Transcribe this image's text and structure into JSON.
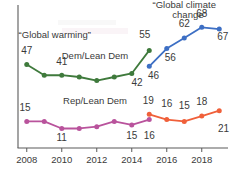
{
  "chart_data": {
    "type": "line",
    "title": "",
    "xlabel": "",
    "ylabel": "",
    "xlim": [
      2007.5,
      2019.5
    ],
    "ylim": [
      0,
      80
    ],
    "grid": false,
    "legend_position": "inline-annotations",
    "x_ticks": [
      "2008",
      "2010",
      "2012",
      "2014",
      "2016",
      "2018"
    ],
    "x_tick_values": [
      2008,
      2010,
      2012,
      2014,
      2016,
      2018
    ],
    "annotations": [
      {
        "text": "“Global warming”",
        "x": 2009.6,
        "y": 62
      },
      {
        "text": "“Global climate",
        "x": 2017.0,
        "y": 79
      },
      {
        "text": "change”",
        "x": 2017.3,
        "y": 73
      }
    ],
    "series": [
      {
        "name": "Dem/Lean Dem",
        "question": "“Global warming”",
        "color": "#3F7A3C",
        "x": [
          2008,
          2009,
          2010,
          2011,
          2012,
          2013,
          2014,
          2015
        ],
        "values": [
          47,
          41,
          41,
          40,
          38,
          40,
          42,
          55
        ],
        "labels": {
          "2008": "47",
          "2010": "41",
          "2014": "42",
          "2015": "55"
        }
      },
      {
        "name": "Dem/Lean Dem",
        "question": "“Global climate change”",
        "color": "#3D6FC4",
        "x": [
          2015,
          2016,
          2017,
          2018,
          2019
        ],
        "values": [
          46,
          56,
          62,
          68,
          67
        ],
        "labels": {
          "2015": "46",
          "2016": "56",
          "2017": "62",
          "2018": "68",
          "2019": "67"
        }
      },
      {
        "name": "Rep/Lean Dem",
        "question": "“Global warming”",
        "color": "#B9539C",
        "x": [
          2008,
          2009,
          2010,
          2011,
          2012,
          2013,
          2014,
          2015
        ],
        "values": [
          15,
          15,
          11,
          11,
          12,
          15,
          13,
          16
        ],
        "labels": {
          "2008": "15",
          "2010": "11",
          "2014": "15",
          "2015": "16"
        }
      },
      {
        "name": "Rep/Lean Dem",
        "question": "“Global climate change”",
        "color": "#F0603A",
        "x": [
          2015,
          2016,
          2017,
          2018,
          2019
        ],
        "values": [
          19,
          16,
          15,
          18,
          21
        ],
        "labels": {
          "2015": "19",
          "2016": "16",
          "2017": "15",
          "2018": "18",
          "2019": "21"
        }
      }
    ],
    "inline_labels": [
      {
        "text": "Dem/Lean Dem",
        "x": 2011.9,
        "y": 50
      },
      {
        "text": "Rep/Lean Dem",
        "x": 2011.9,
        "y": 25
      }
    ],
    "value_labels": [
      {
        "series": "dem-warming",
        "text": "47",
        "x": 2008.0,
        "y": 53,
        "anchor": "middle"
      },
      {
        "series": "dem-warming",
        "text": "41",
        "x": 2010.0,
        "y": 47,
        "anchor": "middle"
      },
      {
        "series": "dem-warming",
        "text": "42",
        "x": 2014.3,
        "y": 35,
        "anchor": "middle"
      },
      {
        "series": "dem-warming",
        "text": "55",
        "x": 2014.75,
        "y": 62,
        "anchor": "middle"
      },
      {
        "series": "dem-climate",
        "text": "46",
        "x": 2015.25,
        "y": 39,
        "anchor": "middle"
      },
      {
        "series": "dem-climate",
        "text": "56",
        "x": 2016.2,
        "y": 49,
        "anchor": "middle"
      },
      {
        "series": "dem-climate",
        "text": "62",
        "x": 2017.0,
        "y": 68,
        "anchor": "middle"
      },
      {
        "series": "dem-climate",
        "text": "68",
        "x": 2018.0,
        "y": 74,
        "anchor": "middle"
      },
      {
        "series": "dem-climate",
        "text": "67",
        "x": 2019.2,
        "y": 61,
        "anchor": "middle"
      },
      {
        "series": "rep-warming",
        "text": "15",
        "x": 2007.9,
        "y": 21,
        "anchor": "middle"
      },
      {
        "series": "rep-warming",
        "text": "11",
        "x": 2010.0,
        "y": 4,
        "anchor": "middle"
      },
      {
        "series": "rep-warming",
        "text": "15",
        "x": 2014.0,
        "y": 5,
        "anchor": "middle"
      },
      {
        "series": "rep-warming",
        "text": "16",
        "x": 2015.0,
        "y": 5,
        "anchor": "middle"
      },
      {
        "series": "rep-climate",
        "text": "19",
        "x": 2014.95,
        "y": 25,
        "anchor": "middle"
      },
      {
        "series": "rep-climate",
        "text": "16",
        "x": 2016.0,
        "y": 23,
        "anchor": "middle"
      },
      {
        "series": "rep-climate",
        "text": "15",
        "x": 2017.0,
        "y": 22,
        "anchor": "middle"
      },
      {
        "series": "rep-climate",
        "text": "18",
        "x": 2018.0,
        "y": 24,
        "anchor": "middle"
      },
      {
        "series": "rep-climate",
        "text": "21",
        "x": 2019.25,
        "y": 9,
        "anchor": "middle"
      }
    ],
    "axis_color": "#5a5a5a",
    "text_color": "#3a3a3a"
  }
}
